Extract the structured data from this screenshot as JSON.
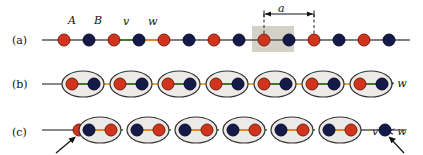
{
  "figure": {
    "type": "ssh-model-lattice-diagram",
    "panels": [
      {
        "id": "a",
        "label": "(a)",
        "description": "dimerized one-dimensional chain with alternating A and B sites",
        "site_labels": [
          {
            "text": "A",
            "x": 69,
            "y": 22
          },
          {
            "text": "B",
            "x": 95,
            "y": 22
          },
          {
            "text": "v",
            "x": 124,
            "y": 23
          },
          {
            "text": "w",
            "x": 149,
            "y": 23
          }
        ],
        "unit_cell_label": "a",
        "sites": [
          {
            "type": "A",
            "x": 64
          },
          {
            "type": "B",
            "x": 89
          },
          {
            "type": "A",
            "x": 114
          },
          {
            "type": "B",
            "x": 139
          },
          {
            "type": "A",
            "x": 164
          },
          {
            "type": "B",
            "x": 189
          },
          {
            "type": "A",
            "x": 214
          },
          {
            "type": "B",
            "x": 239
          },
          {
            "type": "A",
            "x": 264
          },
          {
            "type": "B",
            "x": 289
          },
          {
            "type": "A",
            "x": 314
          },
          {
            "type": "B",
            "x": 339
          },
          {
            "type": "A",
            "x": 364
          },
          {
            "type": "B",
            "x": 389
          }
        ],
        "unit_cell_shade": {
          "x": 252,
          "width": 42
        }
      },
      {
        "id": "b",
        "label": "(b)",
        "description": "strong intracell coupling limit, fully dimerized, no edge states",
        "limit_text": "v ≫ w",
        "dimers": 7
      },
      {
        "id": "c",
        "label": "(c)",
        "description": "strong intercell coupling limit, unpaired edge sites at both ends",
        "limit_text": "v ≪ w",
        "dimers": 6,
        "edge_site_left": "A",
        "edge_site_right": "B",
        "arrows": 2
      }
    ],
    "colors": {
      "site_a": "#d1341c",
      "site_a_edge": "#7a1c0c",
      "site_b": "#151a4a",
      "site_b_edge": "#0a0d2c",
      "bond_v": "#3f7a2a",
      "bond_w": "#e8862a",
      "chain_line": "#555555",
      "unit_cell_shade": "#cdc9bd",
      "ellipse_fill": "#eceae6",
      "ellipse_stroke": "#333333",
      "text": "#111111"
    }
  }
}
